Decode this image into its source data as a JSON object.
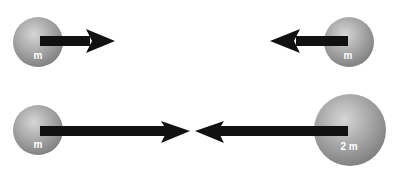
{
  "diagram": {
    "rows": [
      {
        "left_ball": {
          "label": "m",
          "direction": "right"
        },
        "right_ball": {
          "label": "m",
          "direction": "left"
        }
      },
      {
        "left_ball": {
          "label": "m",
          "direction": "right"
        },
        "right_ball": {
          "label": "2 m",
          "direction": "left"
        }
      }
    ],
    "colors": {
      "ball": "#9a9a9a",
      "ball_highlight": "#d8d8d8",
      "arrow": "#111111",
      "label": "#ffffff"
    }
  }
}
